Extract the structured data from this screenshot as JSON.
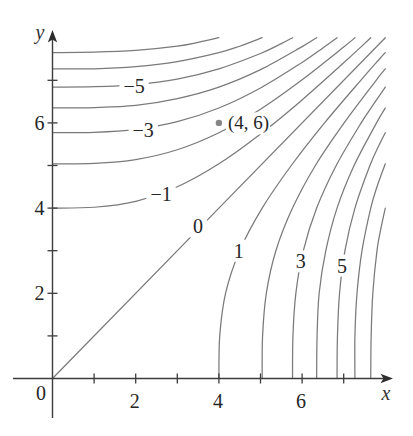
{
  "chart_data": {
    "type": "contour",
    "title": "",
    "xlabel": "x",
    "ylabel": "y",
    "origin_label": "0",
    "xlim": [
      0,
      8
    ],
    "ylim": [
      0,
      8
    ],
    "grid": false,
    "legend": null,
    "x_ticks": [
      1,
      2,
      3,
      4,
      5,
      6,
      7
    ],
    "y_ticks": [
      1,
      2,
      3,
      4,
      5,
      6,
      7
    ],
    "x_tick_labels": [
      {
        "value": 2,
        "label": "2"
      },
      {
        "value": 4,
        "label": "4"
      },
      {
        "value": 6,
        "label": "6"
      }
    ],
    "y_tick_labels": [
      {
        "value": 2,
        "label": "2"
      },
      {
        "value": 4,
        "label": "4"
      },
      {
        "value": 6,
        "label": "6"
      }
    ],
    "levels": [
      -7,
      -6,
      -5,
      -4,
      -3,
      -2,
      -1,
      0,
      1,
      2,
      3,
      4,
      5,
      6,
      7
    ],
    "contours": [
      {
        "level": -7,
        "label": null,
        "points": [
          [
            0,
            7.65
          ],
          [
            1,
            7.66
          ],
          [
            2,
            7.7
          ],
          [
            3,
            7.8
          ],
          [
            3.5,
            7.89
          ],
          [
            4,
            8
          ]
        ]
      },
      {
        "level": -6,
        "label": null,
        "points": [
          [
            0,
            7.27
          ],
          [
            1,
            7.27
          ],
          [
            2,
            7.32
          ],
          [
            3,
            7.44
          ],
          [
            4,
            7.65
          ],
          [
            4.5,
            7.8
          ],
          [
            5.04,
            8
          ]
        ]
      },
      {
        "level": -5,
        "label": "−5",
        "label_at": [
          1.96,
          6.87
        ],
        "points": [
          [
            0,
            6.84
          ],
          [
            1,
            6.85
          ],
          [
            2,
            6.9
          ],
          [
            3,
            7.03
          ],
          [
            4,
            7.27
          ],
          [
            5,
            7.63
          ],
          [
            5.5,
            7.86
          ],
          [
            5.77,
            8
          ]
        ]
      },
      {
        "level": -4,
        "label": null,
        "points": [
          [
            0,
            6.35
          ],
          [
            1,
            6.36
          ],
          [
            2,
            6.41
          ],
          [
            3,
            6.57
          ],
          [
            4,
            6.84
          ],
          [
            5,
            7.25
          ],
          [
            6,
            7.79
          ],
          [
            6.35,
            8
          ]
        ]
      },
      {
        "level": -3,
        "label": "−3",
        "label_at": [
          2.18,
          5.83
        ],
        "points": [
          [
            0,
            5.77
          ],
          [
            1,
            5.78
          ],
          [
            2,
            5.85
          ],
          [
            3,
            6.03
          ],
          [
            4,
            6.35
          ],
          [
            5,
            6.82
          ],
          [
            6,
            7.42
          ],
          [
            6.5,
            7.76
          ],
          [
            6.84,
            8
          ]
        ]
      },
      {
        "level": -2,
        "label": null,
        "points": [
          [
            0,
            5.04
          ],
          [
            1,
            5.05
          ],
          [
            2,
            5.14
          ],
          [
            3,
            5.37
          ],
          [
            4,
            5.77
          ],
          [
            5,
            6.32
          ],
          [
            6,
            7.01
          ],
          [
            7,
            7.78
          ],
          [
            7.27,
            8
          ]
        ]
      },
      {
        "level": -1,
        "label": "−1",
        "label_at": [
          2.61,
          4.32
        ],
        "points": [
          [
            0,
            4
          ],
          [
            1,
            4.02
          ],
          [
            2,
            4.16
          ],
          [
            3,
            4.5
          ],
          [
            4,
            5.04
          ],
          [
            5,
            5.74
          ],
          [
            6,
            6.54
          ],
          [
            7,
            7.41
          ],
          [
            7.5,
            7.86
          ],
          [
            7.65,
            8
          ]
        ]
      },
      {
        "level": 0,
        "label": "0",
        "label_at": [
          3.5,
          3.57
        ],
        "points": [
          [
            0,
            0
          ],
          [
            8,
            8
          ]
        ]
      },
      {
        "level": 1,
        "label": "1",
        "label_at": [
          4.48,
          3.0
        ],
        "points": [
          [
            4,
            0
          ],
          [
            4.02,
            1
          ],
          [
            4.16,
            2
          ],
          [
            4.5,
            3
          ],
          [
            5.04,
            4
          ],
          [
            5.74,
            5
          ],
          [
            6.54,
            6
          ],
          [
            7.41,
            7
          ],
          [
            7.86,
            7.5
          ],
          [
            8,
            7.65
          ]
        ]
      },
      {
        "level": 2,
        "label": null,
        "points": [
          [
            5.04,
            0
          ],
          [
            5.05,
            1
          ],
          [
            5.14,
            2
          ],
          [
            5.37,
            3
          ],
          [
            5.77,
            4
          ],
          [
            6.32,
            5
          ],
          [
            7.01,
            6
          ],
          [
            7.78,
            7
          ],
          [
            8,
            7.27
          ]
        ]
      },
      {
        "level": 3,
        "label": "3",
        "label_at": [
          5.97,
          2.75
        ],
        "points": [
          [
            5.77,
            0
          ],
          [
            5.78,
            1
          ],
          [
            5.85,
            2
          ],
          [
            6.03,
            3
          ],
          [
            6.35,
            4
          ],
          [
            6.82,
            5
          ],
          [
            7.42,
            6
          ],
          [
            7.76,
            6.5
          ],
          [
            8,
            6.84
          ]
        ]
      },
      {
        "level": 4,
        "label": null,
        "points": [
          [
            6.35,
            0
          ],
          [
            6.36,
            1
          ],
          [
            6.41,
            2
          ],
          [
            6.57,
            3
          ],
          [
            6.84,
            4
          ],
          [
            7.25,
            5
          ],
          [
            7.79,
            6
          ],
          [
            8,
            6.35
          ]
        ]
      },
      {
        "level": 5,
        "label": "5",
        "label_at": [
          6.96,
          2.65
        ],
        "points": [
          [
            6.84,
            0
          ],
          [
            6.85,
            1
          ],
          [
            6.9,
            2
          ],
          [
            7.03,
            3
          ],
          [
            7.27,
            4
          ],
          [
            7.63,
            5
          ],
          [
            7.86,
            5.5
          ],
          [
            8,
            5.77
          ]
        ]
      },
      {
        "level": 6,
        "label": null,
        "points": [
          [
            7.27,
            0
          ],
          [
            7.27,
            1
          ],
          [
            7.32,
            2
          ],
          [
            7.44,
            3
          ],
          [
            7.65,
            4
          ],
          [
            7.8,
            4.5
          ],
          [
            8,
            5.04
          ]
        ]
      },
      {
        "level": 7,
        "label": null,
        "points": [
          [
            7.65,
            0
          ],
          [
            7.66,
            1
          ],
          [
            7.7,
            2
          ],
          [
            7.8,
            3
          ],
          [
            7.89,
            3.5
          ],
          [
            8,
            4
          ]
        ]
      }
    ],
    "highlighted_point": {
      "x": 4,
      "y": 6,
      "label": "(4, 6)"
    }
  },
  "colors": {
    "background": "#ffffff",
    "axis": "#3c3c3c",
    "contour": "#7a7a7a",
    "text": "#262626",
    "point": "#858585"
  }
}
